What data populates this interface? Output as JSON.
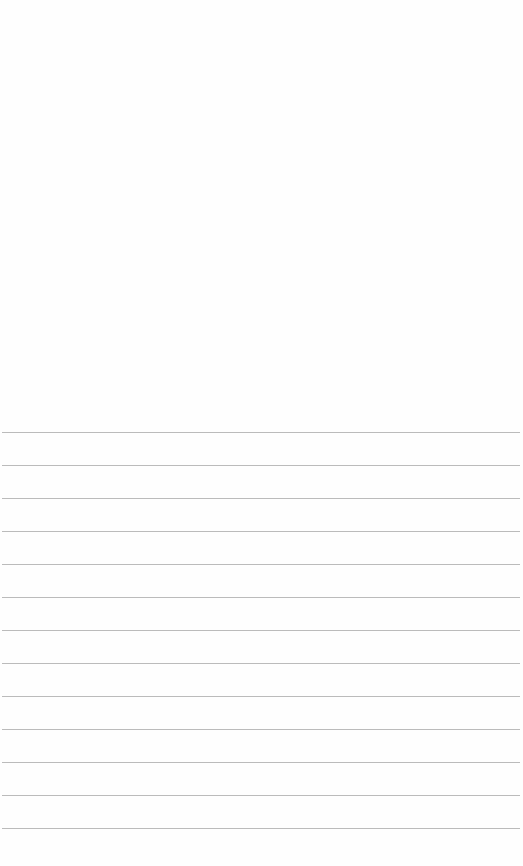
{
  "document": {
    "type": "lined-paper",
    "background_color": "#fefefe",
    "line_color": "#b4b4b4",
    "ruled_lines": {
      "count": 13,
      "first_y": 432,
      "spacing": 33,
      "x_start": 2,
      "x_end": 520,
      "positions_y": [
        432,
        465,
        498,
        531,
        564,
        597,
        630,
        663,
        696,
        729,
        762,
        795,
        828
      ]
    },
    "text": ""
  }
}
